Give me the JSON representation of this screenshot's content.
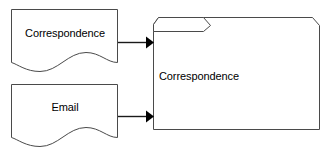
{
  "diagram": {
    "type": "flow-diagram",
    "background_color": "#ffffff",
    "outline_color": "#4a4a4a",
    "arrow_color": "#000000",
    "text_color": "#000000",
    "nodes": [
      {
        "id": "doc-correspondence",
        "shape": "document",
        "label": "Correspondence",
        "x": 11,
        "y": 9,
        "width": 107,
        "height": 63
      },
      {
        "id": "doc-email",
        "shape": "document",
        "label": "Email",
        "x": 11,
        "y": 84,
        "width": 107,
        "height": 63
      },
      {
        "id": "folder-correspondence",
        "shape": "folder",
        "label": "Correspondence",
        "x": 153,
        "y": 17,
        "width": 167,
        "height": 113
      }
    ],
    "edges": [
      {
        "id": "edge-correspondence-to-folder",
        "from": "doc-correspondence",
        "to": "folder-correspondence",
        "arrowhead": "solid-triangle",
        "direction": "right"
      },
      {
        "id": "edge-email-to-folder",
        "from": "doc-email",
        "to": "folder-correspondence",
        "arrowhead": "solid-triangle",
        "direction": "right"
      }
    ]
  }
}
